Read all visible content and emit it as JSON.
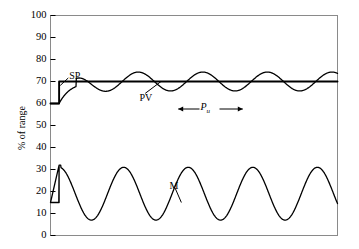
{
  "chart_data": {
    "type": "line",
    "title": "",
    "xlabel": "",
    "ylabel": "% of range",
    "ylim": [
      0,
      100
    ],
    "ytick_labels": [
      "100",
      "90",
      "80",
      "70",
      "60",
      "50",
      "40",
      "30",
      "20",
      "10",
      "0"
    ],
    "ytick_values": [
      100,
      90,
      80,
      70,
      60,
      50,
      40,
      30,
      20,
      10,
      0
    ],
    "xlim": [
      0,
      100
    ],
    "xtick_labels": [],
    "grid": false,
    "legend": "inline-annotations",
    "annotations": [
      {
        "name": "SP",
        "text": "SP",
        "x": 6.5,
        "y": 72.5,
        "target_x": 3.0,
        "target_y": 68.0
      },
      {
        "name": "PV",
        "text": "PV",
        "x": 31.0,
        "y": 62.5,
        "target_x": 39.0,
        "target_y": 70.5
      },
      {
        "name": "M",
        "text": "M",
        "x": 41.5,
        "y": 22.5,
        "target_x": 45.0,
        "target_y": 15.0
      },
      {
        "name": "Pu",
        "text": "P",
        "subscript": "u",
        "x": 53.0,
        "y": 57.5
      }
    ],
    "period_marker": {
      "label": "P",
      "subscript": "u",
      "x_start": 44.5,
      "x_end": 67.0,
      "y": 57.5,
      "description": "ultimate period between successive troughs of PV oscillation"
    },
    "series": [
      {
        "name": "SP",
        "label": "SP",
        "type": "step",
        "color": "#000000",
        "linewidth": 1.9,
        "description": "Setpoint: step change from 60 to 70 percent of range at t=3",
        "x": [
          0,
          3,
          3,
          100
        ],
        "values": [
          60,
          60,
          70,
          70
        ]
      },
      {
        "name": "PV",
        "label": "PV",
        "type": "line",
        "color": "#000000",
        "linewidth": 1.3,
        "description": "Process variable: starts at 60, rises and settles into sustained oscillation about 70 with amplitude about 4.3 and period about 22.5",
        "baseline": 70,
        "amplitude": 4.3,
        "period": 22.5,
        "start_value": 60,
        "rise_start": 3,
        "rise_end": 14
      },
      {
        "name": "M",
        "label": "M",
        "type": "line",
        "color": "#000000",
        "linewidth": 1.3,
        "description": "Controller output: starts at 15, steps to 32 at t=3, then sustained oscillation about 19 with amplitude about 12 and period about 22.5",
        "baseline": 19,
        "amplitude": 12,
        "period": 22.5,
        "start_value": 15,
        "step_value": 32,
        "step_x": 3
      }
    ]
  },
  "figure": {
    "background_color": "#ffffff",
    "frame_color": "#808080",
    "curve_color": "#000000"
  }
}
